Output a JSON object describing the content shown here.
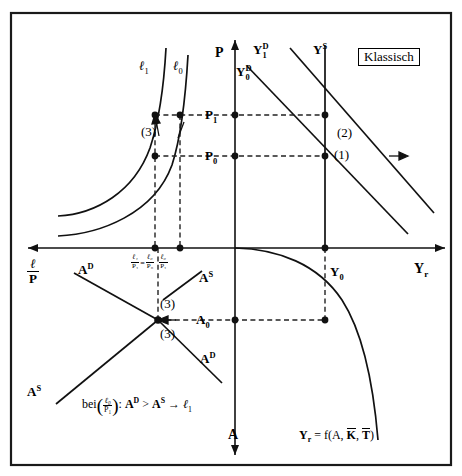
{
  "figure": {
    "title_box": "Klassisch",
    "domain": "macroeconomics-classical-model-four-quadrant-diagram"
  },
  "axes": {
    "vertical_top_label": "P",
    "vertical_bottom_label": "A",
    "right_label_Y": "Y",
    "right_label_Y_sub": "r",
    "left_label_num": "ℓ",
    "left_label_den": "P"
  },
  "curves": {
    "labour_left_1": "ℓ",
    "labour_left_1_sub": "1",
    "labour_left_0": "ℓ",
    "labour_left_0_sub": "0",
    "demand_1": "Y",
    "demand_1_sub": "1",
    "demand_1_sup": "D",
    "demand_0": "Y",
    "demand_0_sub": "0",
    "demand_0_sup": "D",
    "supply": "Y",
    "supply_sup": "S",
    "labour_demand_upper": "A",
    "labour_demand_upper_sup": "D",
    "labour_supply_upper": "A",
    "labour_supply_upper_sup": "S",
    "labour_demand_lower": "A",
    "labour_demand_lower_sup": "D",
    "labour_supply_lower": "A",
    "labour_supply_lower_sup": "S"
  },
  "ticks": {
    "price_1": "P",
    "price_1_sub": "1",
    "price_0": "P",
    "price_0_sub": "0",
    "output_0": "Y",
    "output_0_sub": "0",
    "employment_0": "A",
    "employment_0_sub": "0",
    "real_wage_1": {
      "num": "ℓ₁",
      "den": "P₁"
    },
    "equals": "=",
    "real_wage_0": {
      "num": "ℓ₀",
      "den": "P₀"
    },
    "real_wage_mid": {
      "num": "ℓ₀",
      "den": "P₁"
    }
  },
  "annotations": {
    "step_1": "(1)",
    "step_2": "(2)",
    "step_3_upper": "(3)",
    "step_3_mid": "(3)",
    "step_3_lower": "(3)",
    "caption_prefix": "bei",
    "caption_frac_num": "ℓ₀",
    "caption_frac_den": "P₁",
    "caption_colon": ":",
    "caption_A": "A",
    "caption_A_sup": "D",
    "caption_gt": ">",
    "caption_B": "A",
    "caption_B_sup": "S",
    "caption_arrow": "→",
    "caption_result": "ℓ",
    "caption_result_sub": "1",
    "production_fn": "Y",
    "production_fn_sub": "r",
    "production_fn_rest": " = f(A, K, T)",
    "production_fn_K": "K",
    "production_fn_T": "T"
  },
  "colors": {
    "line": "#111111",
    "dashed": "#222222",
    "frame": "#1a1a1a",
    "background": "#ffffff"
  }
}
